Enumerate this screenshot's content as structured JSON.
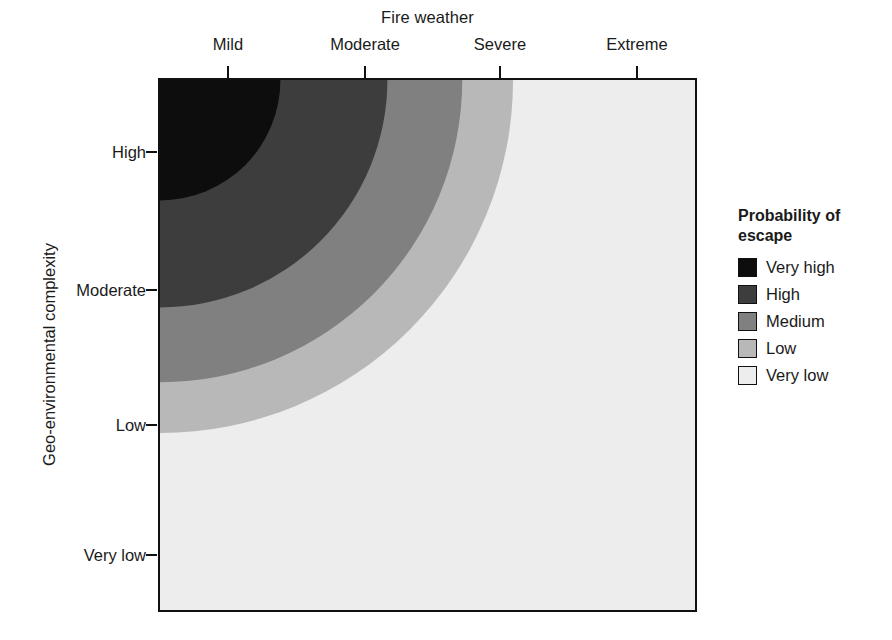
{
  "chart_data": {
    "type": "heatmap",
    "title": "",
    "xlabel": "Fire weather",
    "ylabel": "Geo-environmental complexity",
    "x_tick_labels": [
      "Mild",
      "Moderate",
      "Severe",
      "Extreme"
    ],
    "y_tick_labels": [
      "High",
      "Moderate",
      "Low",
      "Very low"
    ],
    "x_axis_position": "top",
    "y_axis_position": "left",
    "grid": false,
    "legend_position": "right",
    "legend_title": "Probability of escape",
    "legend_entries": [
      {
        "label": "Very high",
        "color": "#0d0d0d"
      },
      {
        "label": "High",
        "color": "#3d3d3d"
      },
      {
        "label": "Medium",
        "color": "#808080"
      },
      {
        "label": "Low",
        "color": "#b8b8b8"
      },
      {
        "label": "Very low",
        "color": "#ededed"
      }
    ],
    "bands": [
      {
        "class": "Very high",
        "color": "#0d0d0d",
        "outer_radius_fraction": 0.225
      },
      {
        "class": "High",
        "color": "#3d3d3d",
        "outer_radius_fraction": 0.425
      },
      {
        "class": "Medium",
        "color": "#808080",
        "outer_radius_fraction": 0.565
      },
      {
        "class": "Low",
        "color": "#b8b8b8",
        "outer_radius_fraction": 0.66
      },
      {
        "class": "Very low",
        "color": "#ededed",
        "outer_radius_fraction": 2.0
      }
    ],
    "band_boundaries_top_edge_x_fraction": [
      0.225,
      0.425,
      0.565,
      0.66
    ],
    "band_boundaries_left_edge_y_fraction": [
      0.227,
      0.43,
      0.57,
      0.665
    ],
    "x_tick_fractions": [
      0.13,
      0.385,
      0.635,
      0.888
    ],
    "y_tick_fractions": [
      0.139,
      0.397,
      0.65,
      0.893
    ]
  },
  "axes": {
    "x_title": "Fire weather",
    "y_title": "Geo-environmental complexity",
    "x_ticks": [
      {
        "label": "Mild",
        "pos": 0.13
      },
      {
        "label": "Moderate",
        "pos": 0.385
      },
      {
        "label": "Severe",
        "pos": 0.635
      },
      {
        "label": "Extreme",
        "pos": 0.888
      }
    ],
    "y_ticks": [
      {
        "label": "High",
        "pos": 0.139
      },
      {
        "label": "Moderate",
        "pos": 0.397
      },
      {
        "label": "Low",
        "pos": 0.65
      },
      {
        "label": "Very low",
        "pos": 0.893
      }
    ]
  },
  "legend": {
    "title_line1": "Probability of",
    "title_line2": "escape",
    "items": [
      {
        "label": "Very high",
        "color": "#0d0d0d"
      },
      {
        "label": "High",
        "color": "#3d3d3d"
      },
      {
        "label": "Medium",
        "color": "#808080"
      },
      {
        "label": "Low",
        "color": "#b8b8b8"
      },
      {
        "label": "Very low",
        "color": "#ededed"
      }
    ]
  }
}
